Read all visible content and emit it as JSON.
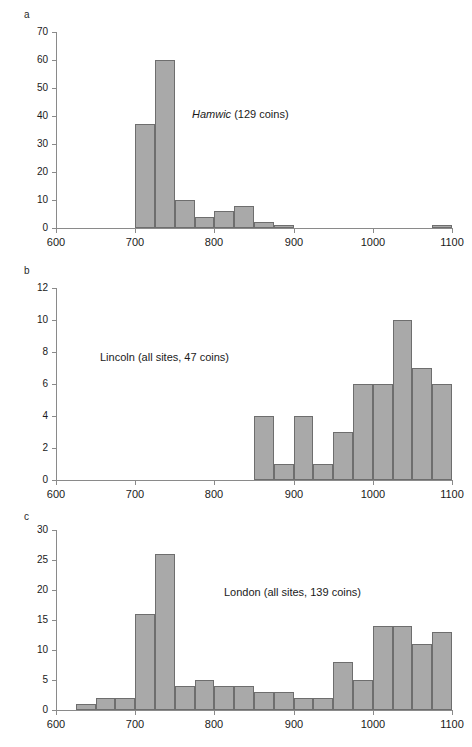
{
  "figure": {
    "panels": [
      {
        "letter": "a",
        "label_italic": "Hamwic",
        "label_rest": " (129 coins)",
        "chart_data": {
          "type": "bar",
          "title": "Hamwic (129 coins)",
          "xlabel": "",
          "ylabel": "",
          "bin_width": 25,
          "xlim": [
            600,
            1100
          ],
          "ylim": [
            0,
            70
          ],
          "ytick_labels": [
            "0",
            "10",
            "20",
            "30",
            "40",
            "50",
            "60",
            "70"
          ],
          "yticks": [
            0,
            10,
            20,
            30,
            40,
            50,
            60,
            70
          ],
          "xtick_labels": [
            "600",
            "700",
            "800",
            "900",
            "1000",
            "1100"
          ],
          "xticks": [
            600,
            700,
            800,
            900,
            1000,
            1100
          ],
          "grid": false,
          "legend": "none",
          "bins": [
            700,
            725,
            750,
            775,
            800,
            825,
            850,
            875,
            1075
          ],
          "values": [
            37,
            60,
            10,
            4,
            6,
            8,
            2,
            1,
            1
          ]
        }
      },
      {
        "letter": "b",
        "label_italic": "",
        "label_rest": "Lincoln (all sites, 47 coins)",
        "chart_data": {
          "type": "bar",
          "title": "Lincoln (all sites, 47 coins)",
          "xlabel": "",
          "ylabel": "",
          "bin_width": 25,
          "xlim": [
            600,
            1100
          ],
          "ylim": [
            0,
            12
          ],
          "ytick_labels": [
            "0",
            "2",
            "4",
            "6",
            "8",
            "10",
            "12"
          ],
          "yticks": [
            0,
            2,
            4,
            6,
            8,
            10,
            12
          ],
          "xtick_labels": [
            "600",
            "700",
            "800",
            "900",
            "1000",
            "1100"
          ],
          "xticks": [
            600,
            700,
            800,
            900,
            1000,
            1100
          ],
          "grid": false,
          "legend": "none",
          "bins": [
            850,
            875,
            900,
            925,
            950,
            975,
            1000,
            1025,
            1050,
            1075
          ],
          "values": [
            4,
            1,
            4,
            1,
            3,
            6,
            6,
            10,
            7,
            6
          ]
        }
      },
      {
        "letter": "c",
        "label_italic": "",
        "label_rest": "London (all sites, 139 coins)",
        "chart_data": {
          "type": "bar",
          "title": "London (all sites, 139 coins)",
          "xlabel": "",
          "ylabel": "",
          "bin_width": 25,
          "xlim": [
            600,
            1100
          ],
          "ylim": [
            0,
            30
          ],
          "ytick_labels": [
            "0",
            "5",
            "10",
            "15",
            "20",
            "25",
            "30"
          ],
          "yticks": [
            0,
            5,
            10,
            15,
            20,
            25,
            30
          ],
          "xtick_labels": [
            "600",
            "700",
            "800",
            "900",
            "1000",
            "1100"
          ],
          "xticks": [
            600,
            700,
            800,
            900,
            1000,
            1100
          ],
          "grid": false,
          "legend": "none",
          "bins": [
            625,
            650,
            675,
            700,
            725,
            750,
            775,
            800,
            825,
            850,
            875,
            900,
            925,
            950,
            975,
            1000,
            1025,
            1050,
            1075
          ],
          "values": [
            1,
            2,
            2,
            16,
            26,
            4,
            5,
            4,
            4,
            3,
            3,
            2,
            2,
            8,
            5,
            14,
            14,
            11,
            13
          ]
        }
      }
    ]
  }
}
